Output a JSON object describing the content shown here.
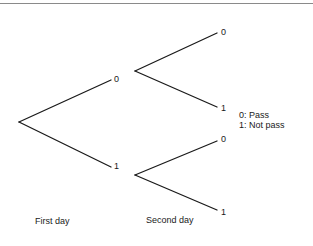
{
  "diagram": {
    "type": "probability-tree",
    "root": {
      "x": 19,
      "y": 122
    },
    "levels": [
      {
        "label": "First day"
      },
      {
        "label": "Second day"
      }
    ],
    "first_day_nodes": [
      {
        "label": "0",
        "x": 111,
        "y": 80
      },
      {
        "label": "1",
        "x": 111,
        "y": 167
      }
    ],
    "second_day_nodes": [
      {
        "parent": "0",
        "label": "0",
        "x": 217,
        "y": 33
      },
      {
        "parent": "0",
        "label": "1",
        "x": 217,
        "y": 107
      },
      {
        "parent": "1",
        "label": "0",
        "x": 217,
        "y": 141
      },
      {
        "parent": "1",
        "label": "1",
        "x": 217,
        "y": 210
      }
    ],
    "legend": [
      "0: Pass",
      "1: Not pass"
    ],
    "line_color": "#1a1a1a"
  }
}
